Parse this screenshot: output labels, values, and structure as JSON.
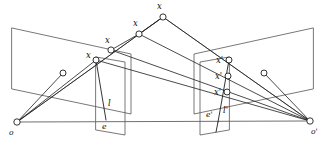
{
  "figure": {
    "background_color": "#ffffff",
    "line_color": "#1d1d1d",
    "plane_color": "#555555",
    "node_fill": "#ffffff"
  },
  "labels": {
    "scene_point_top": "x",
    "scene_point_mid": "x",
    "scene_point_low": "x",
    "left_image_point": "x",
    "left_epipolar_line": "l",
    "left_epipole": "e",
    "left_camera_center": "o",
    "right_image_point_top": "x'",
    "right_image_point_mid": "x'",
    "right_image_point_low": "x'",
    "right_epipolar_line": "l'",
    "right_epipole": "e'",
    "right_camera_center": "o'"
  },
  "geometry": {
    "left_camera_center": {
      "x": 17,
      "y": 122
    },
    "right_camera_center": {
      "x": 310,
      "y": 121
    },
    "left_backplane": [
      {
        "x": 12,
        "y": 28
      },
      {
        "x": 131,
        "y": 54
      },
      {
        "x": 131,
        "y": 114
      },
      {
        "x": 12,
        "y": 89
      }
    ],
    "right_backplane": [
      {
        "x": 313,
        "y": 28
      },
      {
        "x": 194,
        "y": 54
      },
      {
        "x": 194,
        "y": 114
      },
      {
        "x": 313,
        "y": 89
      }
    ],
    "left_image_plane": [
      {
        "x": 96,
        "y": 57
      },
      {
        "x": 125,
        "y": 62
      },
      {
        "x": 125,
        "y": 135
      },
      {
        "x": 96,
        "y": 130
      }
    ],
    "right_image_plane": [
      {
        "x": 229,
        "y": 57
      },
      {
        "x": 200,
        "y": 62
      },
      {
        "x": 200,
        "y": 135
      },
      {
        "x": 229,
        "y": 130
      }
    ],
    "scene_points": [
      {
        "name": "x-top",
        "x": 163,
        "y": 17
      },
      {
        "name": "x-mid",
        "x": 139,
        "y": 34
      },
      {
        "name": "x-low",
        "x": 111,
        "y": 50
      }
    ],
    "left_image_point": {
      "x": 96,
      "y": 60
    },
    "left_epipole": {
      "x": 106,
      "y": 120
    },
    "right_image_points": [
      {
        "name": "x-prime-top",
        "x": 229,
        "y": 60
      },
      {
        "name": "x-prime-mid",
        "x": 228,
        "y": 76
      },
      {
        "name": "x-prime-low",
        "x": 227,
        "y": 92
      }
    ],
    "right_epipole": {
      "x": 218,
      "y": 122
    },
    "left_aux_point": {
      "x": 63,
      "y": 73
    },
    "right_aux_point": {
      "x": 264,
      "y": 73
    },
    "label_positions": {
      "scene_point_top": {
        "x": 157,
        "y": 9
      },
      "scene_point_mid": {
        "x": 133,
        "y": 26
      },
      "scene_point_low": {
        "x": 105,
        "y": 43
      },
      "left_image_point": {
        "x": 88,
        "y": 58
      },
      "left_epipolar_line": {
        "x": 108,
        "y": 106
      },
      "left_epipole": {
        "x": 103,
        "y": 128
      },
      "left_camera_center": {
        "x": 10,
        "y": 134
      },
      "right_image_point_top": {
        "x": 218,
        "y": 63
      },
      "right_image_point_mid": {
        "x": 217,
        "y": 79
      },
      "right_image_point_low": {
        "x": 216,
        "y": 95
      },
      "right_epipolar_line": {
        "x": 224,
        "y": 113
      },
      "right_epipole": {
        "x": 208,
        "y": 117
      },
      "right_camera_center": {
        "x": 313,
        "y": 133
      }
    }
  }
}
